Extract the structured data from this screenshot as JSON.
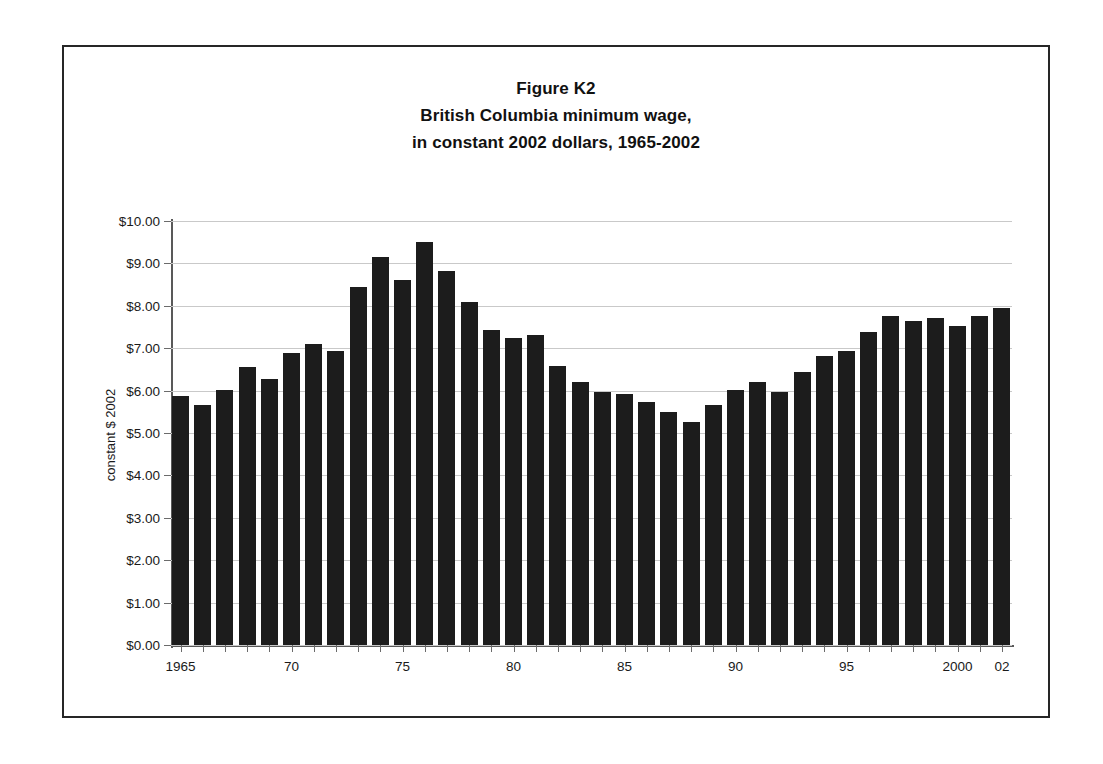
{
  "figure": {
    "title_lines": [
      "Figure K2",
      "British Columbia minimum wage,",
      "in constant 2002 dollars, 1965-2002"
    ],
    "border_color": "#262626",
    "bar_color": "#1c1c1c",
    "gridline_color": "#c9c9c9"
  },
  "chart_data": {
    "type": "bar",
    "title": "Figure K2 British Columbia minimum wage, in constant 2002 dollars, 1965-2002",
    "xlabel": "",
    "ylabel": "constant $ 2002",
    "ylim": [
      0,
      10
    ],
    "ytick_labels": [
      "$0.00",
      "$1.00",
      "$2.00",
      "$3.00",
      "$4.00",
      "$5.00",
      "$6.00",
      "$7.00",
      "$8.00",
      "$9.00",
      "$10.00"
    ],
    "ytick_values": [
      0,
      1,
      2,
      3,
      4,
      5,
      6,
      7,
      8,
      9,
      10
    ],
    "grid": true,
    "legend": "none",
    "x_axis_tick_every": 1,
    "x_labeled_years": [
      1965,
      1970,
      1975,
      1980,
      1985,
      1990,
      1995,
      2000,
      2002
    ],
    "x_labeled_text": [
      "1965",
      "70",
      "75",
      "80",
      "85",
      "90",
      "95",
      "2000",
      "02"
    ],
    "categories": [
      1965,
      1966,
      1967,
      1968,
      1969,
      1970,
      1971,
      1972,
      1973,
      1974,
      1975,
      1976,
      1977,
      1978,
      1979,
      1980,
      1981,
      1982,
      1983,
      1984,
      1985,
      1986,
      1987,
      1988,
      1989,
      1990,
      1991,
      1992,
      1993,
      1994,
      1995,
      1996,
      1997,
      1998,
      1999,
      2000,
      2001,
      2002
    ],
    "values": [
      5.87,
      5.65,
      6.02,
      6.55,
      6.27,
      6.89,
      7.1,
      6.93,
      8.44,
      9.15,
      8.6,
      9.51,
      8.82,
      8.1,
      7.42,
      7.24,
      7.3,
      6.58,
      6.21,
      5.97,
      5.92,
      5.74,
      5.5,
      5.26,
      5.65,
      6.02,
      6.21,
      5.97,
      6.43,
      6.81,
      6.93,
      7.38,
      7.75,
      7.64,
      7.71,
      7.52,
      7.75,
      7.95
    ]
  }
}
